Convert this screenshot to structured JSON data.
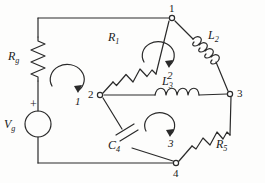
{
  "diagram": {
    "type": "electrical-schematic",
    "line_color": "#2a2a2a",
    "background": "#fdfdfc"
  },
  "source": {
    "label": "V",
    "subscript": "g",
    "polarity_marker": "+",
    "symbol": "circle-source"
  },
  "components": [
    {
      "id": "Rg",
      "label": "R",
      "subscript": "g",
      "kind": "resistor",
      "orientation": "vertical",
      "branch": "left-rail"
    },
    {
      "id": "R1",
      "label": "R",
      "subscript": "1",
      "kind": "resistor",
      "orientation": "diagonal",
      "branch": "node2-node1"
    },
    {
      "id": "L2",
      "label": "L",
      "subscript": "2",
      "kind": "inductor",
      "orientation": "diagonal",
      "branch": "node1-node3"
    },
    {
      "id": "L3",
      "label": "L",
      "subscript": "3",
      "kind": "inductor",
      "orientation": "horizontal",
      "branch": "node2-node3"
    },
    {
      "id": "C4",
      "label": "C",
      "subscript": "4",
      "kind": "capacitor",
      "orientation": "diagonal",
      "branch": "node2-node4"
    },
    {
      "id": "R5",
      "label": "R",
      "subscript": "5",
      "kind": "resistor",
      "orientation": "diagonal",
      "branch": "node4-node3"
    }
  ],
  "nodes": [
    {
      "id": "n1",
      "label": "1",
      "x": 172,
      "y": 18
    },
    {
      "id": "n2",
      "label": "2",
      "x": 100,
      "y": 95
    },
    {
      "id": "n3",
      "label": "3",
      "x": 230,
      "y": 94
    },
    {
      "id": "n4",
      "label": "4",
      "x": 176,
      "y": 163
    }
  ],
  "meshes": [
    {
      "id": "m1",
      "label": "1",
      "direction": "clockwise"
    },
    {
      "id": "m2",
      "label": "2",
      "direction": "clockwise"
    },
    {
      "id": "m3",
      "label": "3",
      "direction": "clockwise"
    }
  ]
}
